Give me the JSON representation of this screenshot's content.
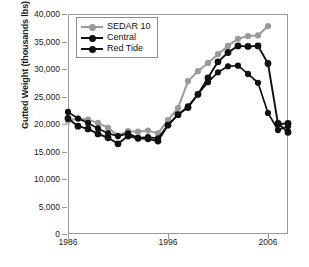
{
  "chart_data": {
    "type": "line",
    "title": "",
    "xlabel": "",
    "ylabel": "Gutted Weight (thousands lbs)",
    "xlim": [
      1986,
      2008
    ],
    "ylim": [
      0,
      40000
    ],
    "xticks": [
      1986,
      1996,
      2006
    ],
    "xtick_labels": [
      "1986",
      "1996",
      "2006"
    ],
    "yticks": [
      0,
      5000,
      10000,
      15000,
      20000,
      25000,
      30000,
      35000,
      40000
    ],
    "ytick_labels": [
      "0",
      "5,000",
      "10,000",
      "15,000",
      "20,000",
      "25,000",
      "30,000",
      "35,000",
      "40,000"
    ],
    "grid": false,
    "legend_position": "upper-left",
    "x": [
      1986,
      1987,
      1988,
      1989,
      1990,
      1991,
      1992,
      1993,
      1994,
      1995,
      1996,
      1997,
      1998,
      1999,
      2000,
      2001,
      2002,
      2003,
      2004,
      2005,
      2006,
      2007,
      2008
    ],
    "series": [
      {
        "name": "SEDAR 10",
        "color": "#9a9a9a",
        "marker": "circle",
        "values": [
          20600,
          21000,
          20800,
          20200,
          19300,
          17900,
          18700,
          18600,
          18800,
          18300,
          20700,
          22900,
          27800,
          29600,
          31100,
          32700,
          34200,
          35500,
          36000,
          36100,
          37800,
          null,
          null
        ]
      },
      {
        "name": "Central",
        "color": "#111111",
        "marker": "circle",
        "values": [
          22200,
          21000,
          20200,
          19200,
          18300,
          17800,
          18300,
          17500,
          17600,
          17400,
          19800,
          21700,
          23200,
          25400,
          27600,
          29400,
          30500,
          30600,
          29100,
          27500,
          22000,
          18900,
          19600
        ]
      },
      {
        "name": "Red Tide",
        "color": "#111111",
        "marker": "circle",
        "values": [
          21000,
          19600,
          19100,
          18200,
          17500,
          16400,
          17800,
          17400,
          17300,
          16900,
          19800,
          21700,
          23000,
          25400,
          28400,
          31300,
          33000,
          34200,
          34100,
          34200,
          31000,
          20000,
          20100
        ]
      },
      {
        "name": "Red Tide tail",
        "color": "#111111",
        "marker": "circle",
        "values": [
          null,
          null,
          null,
          null,
          null,
          null,
          null,
          null,
          null,
          null,
          null,
          null,
          null,
          null,
          null,
          null,
          null,
          null,
          null,
          null,
          null,
          20100,
          18500
        ]
      }
    ],
    "series_legend": [
      "SEDAR 10",
      "Central",
      "Red Tide"
    ]
  }
}
